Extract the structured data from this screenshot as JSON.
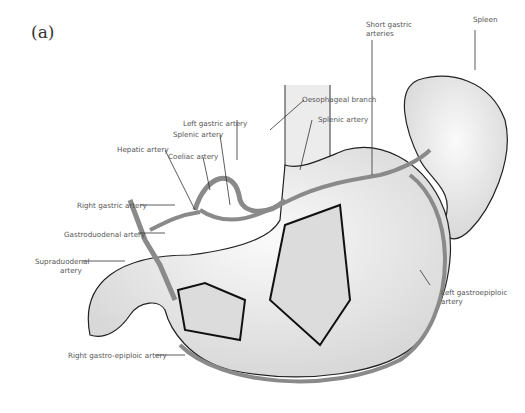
{
  "figure": {
    "panel_label": "(a)"
  },
  "labels": {
    "spleen": "Spleen",
    "short_gastric_1": "Short gastric",
    "short_gastric_2": "arteries",
    "oesophageal_branch": "Oesophageal branch",
    "splenic_artery_right": "Splenic artery",
    "left_gastric_artery": "Left gastric artery",
    "splenic_artery_left": "Splenic artery",
    "hepatic_artery": "Hepatic artery",
    "coeliac_artery": "Coeliac artery",
    "right_gastric_artery": "Right gastric artery",
    "gastroduodenal_artery": "Gastroduodenal artery",
    "supraduodenal_1": "Supraduodenal",
    "supraduodenal_2": "artery",
    "left_gastroepiploic_1": "Left gastroepiploic",
    "left_gastroepiploic_2": "artery",
    "right_gastroepiploic": "Right gastro-epiploic artery"
  },
  "colors": {
    "artery": "#8a8a8a",
    "organ_fill": "#ededed",
    "outline": "#222222",
    "label_text": "#555555"
  }
}
